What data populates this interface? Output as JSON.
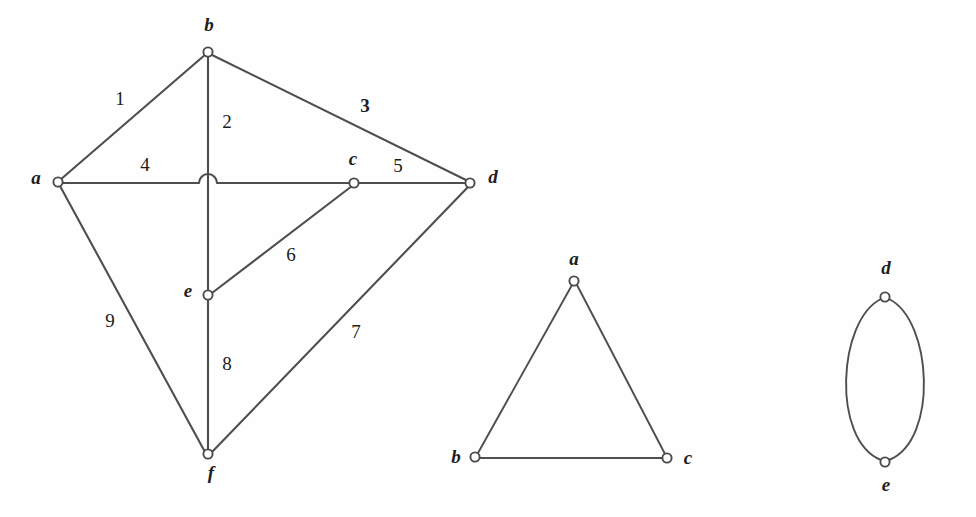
{
  "figure": {
    "type": "graph-diagram",
    "background_color": "#fefefe",
    "ink_color": "#4e4e4e",
    "text_color": "#1b1b1b",
    "width": 976,
    "height": 517,
    "graphs": [
      {
        "id": "graph-left",
        "name": "left-graph",
        "vertices": [
          {
            "id": "a",
            "label": "a",
            "x": 58,
            "y": 182,
            "label_x": 36,
            "label_y": 180
          },
          {
            "id": "b",
            "label": "b",
            "x": 208,
            "y": 52,
            "label_x": 209,
            "label_y": 27
          },
          {
            "id": "c",
            "label": "c",
            "x": 354,
            "y": 183,
            "label_x": 353,
            "label_y": 161
          },
          {
            "id": "d",
            "label": "d",
            "x": 470,
            "y": 183,
            "label_x": 493,
            "label_y": 179
          },
          {
            "id": "e",
            "label": "e",
            "x": 208,
            "y": 295,
            "label_x": 188,
            "label_y": 293
          },
          {
            "id": "f",
            "label": "f",
            "x": 208,
            "y": 454,
            "label_x": 211,
            "label_y": 475
          }
        ],
        "edges": [
          {
            "id": "e1",
            "from": "b",
            "to": "a",
            "label": "1",
            "label_x": 120,
            "label_y": 101,
            "bold": false
          },
          {
            "id": "e2",
            "from": "b",
            "to": "f",
            "label": "2",
            "label_x": 227,
            "label_y": 124,
            "bold": false
          },
          {
            "id": "e3",
            "from": "b",
            "to": "d",
            "label": "3",
            "label_x": 365,
            "label_y": 108,
            "bold": true
          },
          {
            "id": "e4",
            "from": "a",
            "to": "c",
            "label": "4",
            "label_x": 145,
            "label_y": 167,
            "bold": false
          },
          {
            "id": "e5",
            "from": "c",
            "to": "d",
            "label": "5",
            "label_x": 398,
            "label_y": 168,
            "bold": false
          },
          {
            "id": "e6",
            "from": "e",
            "to": "c",
            "label": "6",
            "label_x": 291,
            "label_y": 257,
            "bold": false
          },
          {
            "id": "e7",
            "from": "d",
            "to": "f",
            "label": "7",
            "label_x": 356,
            "label_y": 334,
            "bold": false
          },
          {
            "id": "e8",
            "from": "e",
            "to": "f",
            "label": "8",
            "label_x": 227,
            "label_y": 366,
            "bold": false
          },
          {
            "id": "e9",
            "from": "a",
            "to": "f",
            "label": "9",
            "label_x": 110,
            "label_y": 323,
            "bold": false
          }
        ],
        "crossing_hop": {
          "x": 208,
          "y": 183,
          "radius": 9,
          "note": "edge 4 hops over edge 2"
        }
      },
      {
        "id": "graph-middle",
        "name": "middle-graph-triangle",
        "vertices": [
          {
            "id": "a",
            "label": "a",
            "x": 574,
            "y": 281,
            "label_x": 574,
            "label_y": 261
          },
          {
            "id": "b",
            "label": "b",
            "x": 475,
            "y": 457,
            "label_x": 456,
            "label_y": 459
          },
          {
            "id": "c",
            "label": "c",
            "x": 667,
            "y": 458,
            "label_x": 688,
            "label_y": 460
          }
        ],
        "edges": [
          {
            "id": "m1",
            "from": "a",
            "to": "b",
            "label": "",
            "bold": false
          },
          {
            "id": "m2",
            "from": "a",
            "to": "c",
            "label": "",
            "bold": false
          },
          {
            "id": "m3",
            "from": "b",
            "to": "c",
            "label": "",
            "bold": false
          }
        ]
      },
      {
        "id": "graph-right",
        "name": "right-graph-double-edge",
        "vertices": [
          {
            "id": "d",
            "label": "d",
            "x": 885,
            "y": 297,
            "label_x": 886,
            "label_y": 270
          },
          {
            "id": "e",
            "label": "e",
            "x": 885,
            "y": 462,
            "label_x": 886,
            "label_y": 487
          }
        ],
        "edges": [
          {
            "id": "r1",
            "from": "d",
            "to": "e",
            "label": "",
            "curve": "left",
            "bow": 52
          },
          {
            "id": "r2",
            "from": "d",
            "to": "e",
            "label": "",
            "curve": "right",
            "bow": 52
          }
        ]
      }
    ]
  }
}
